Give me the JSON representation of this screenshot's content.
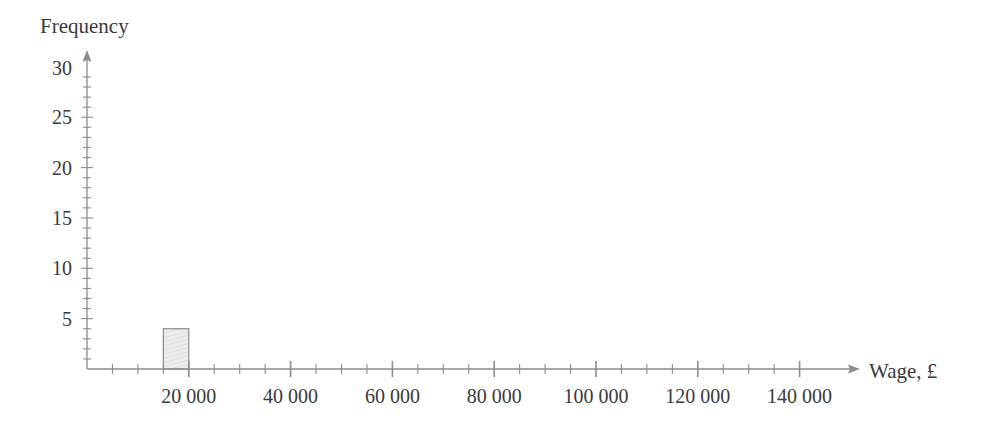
{
  "chart_data": {
    "type": "bar",
    "subtype": "histogram",
    "title": "",
    "xlabel": "Wage, £",
    "ylabel": "Frequency",
    "xlim": [
      0,
      145000
    ],
    "ylim": [
      0,
      30
    ],
    "x_major_ticks": [
      20000,
      40000,
      60000,
      80000,
      100000,
      120000,
      140000
    ],
    "x_tick_labels": [
      "20 000",
      "40 000",
      "60 000",
      "80 000",
      "100 000",
      "120 000",
      "140 000"
    ],
    "x_minor_step": 5000,
    "y_major_ticks": [
      5,
      10,
      15,
      20,
      25,
      30
    ],
    "y_tick_labels": [
      "5",
      "10",
      "15",
      "20",
      "25",
      "30"
    ],
    "y_minor_step": 1,
    "grid": false,
    "bins": [
      {
        "x_start": 15000,
        "x_end": 20000,
        "frequency": 4
      }
    ],
    "colors": {
      "axis": "#8c8c8c",
      "bar_fill": "#ececec",
      "bar_hatch": "#d0d0d0",
      "bar_stroke": "#8c8c8c",
      "text": "#3a3a3a"
    }
  }
}
